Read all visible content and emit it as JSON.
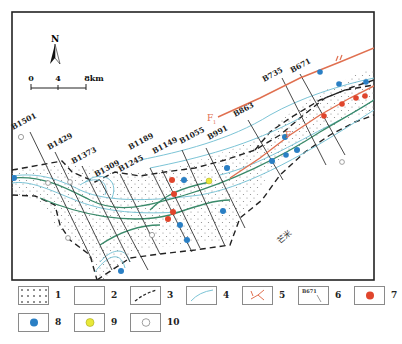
{
  "map": {
    "north_label": "N",
    "scale": {
      "ticks": [
        "0",
        "4",
        "8km"
      ]
    },
    "faults": [
      {
        "id": "F1",
        "label": "F",
        "subscript": "1",
        "roman": "II"
      },
      {
        "id": "F2",
        "label": "F",
        "subscript": ""
      }
    ],
    "section_lines": [
      "B1501",
      "B1429",
      "B1373",
      "B1309",
      "B1245",
      "B1189",
      "B1149",
      "B1055",
      "B991",
      "B863",
      "B735",
      "B671"
    ],
    "place_label": "芒米",
    "colors": {
      "fault": "#e07050",
      "river": "#3a8a6a",
      "channel": "#7cc4d6",
      "well_red": "#e0452c",
      "well_blue": "#2a7fc4",
      "well_yellow": "#e8e838",
      "boundary": "#222222"
    }
  },
  "legend": {
    "items": [
      {
        "num": "1",
        "symbol": "dotted-fill"
      },
      {
        "num": "2",
        "symbol": "blank-fill"
      },
      {
        "num": "3",
        "symbol": "dashed-boundary"
      },
      {
        "num": "4",
        "symbol": "channel-line"
      },
      {
        "num": "5",
        "symbol": "fault-symbol"
      },
      {
        "num": "6",
        "symbol": "section-line",
        "sample": "B671"
      },
      {
        "num": "7",
        "symbol": "red-well"
      },
      {
        "num": "8",
        "symbol": "blue-well"
      },
      {
        "num": "9",
        "symbol": "yellow-well"
      },
      {
        "num": "10",
        "symbol": "open-well"
      }
    ]
  }
}
